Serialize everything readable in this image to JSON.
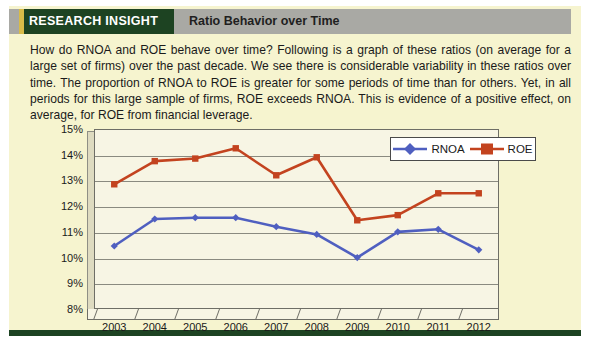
{
  "header": {
    "label": "RESEARCH INSIGHT",
    "title": "Ratio Behavior over Time",
    "label_bg": "#1d4322",
    "accent": "#d8bb49",
    "bar_bg": "#a9a9a4"
  },
  "body": {
    "paragraph": "How do RNOA and ROE behave over time? Following is a graph of these ratios (on average for a large set of firms) over the past decade. We see there is considerable variability in these ratios over time. The proportion of RNOA to ROE is greater for some periods of time than for others. Yet, in all periods for this large sample of firms, ROE exceeds RNOA. This is evidence of a positive effect, on average, for ROE from financial leverage."
  },
  "box": {
    "background": "#f6f4cf",
    "border_color": "#1d4322"
  },
  "chart_data": {
    "type": "line",
    "title": "",
    "xlabel": "",
    "ylabel": "",
    "categories": [
      "2003",
      "2004",
      "2005",
      "2006",
      "2007",
      "2008",
      "2009",
      "2010",
      "2011",
      "2012"
    ],
    "ylim": [
      8,
      15
    ],
    "ytick_labels": [
      "8%",
      "9%",
      "10%",
      "11%",
      "12%",
      "13%",
      "14%",
      "15%"
    ],
    "ytick_values": [
      8,
      9,
      10,
      11,
      12,
      13,
      14,
      15
    ],
    "grid": true,
    "legend_position": "top-right",
    "series": [
      {
        "name": "RNOA",
        "color": "#4f5fc0",
        "marker": "diamond",
        "values": [
          10.45,
          11.5,
          11.55,
          11.55,
          11.2,
          10.9,
          10.0,
          11.0,
          11.1,
          10.3
        ]
      },
      {
        "name": "ROE",
        "color": "#c3431f",
        "marker": "square",
        "values": [
          12.85,
          13.75,
          13.85,
          14.25,
          13.2,
          13.9,
          11.45,
          11.65,
          12.5,
          12.5
        ]
      }
    ]
  }
}
